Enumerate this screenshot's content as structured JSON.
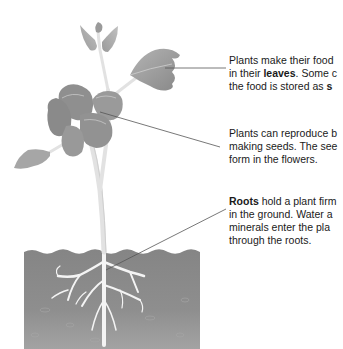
{
  "diagram": {
    "type": "labeled plant anatomy",
    "colors": {
      "soil": "#8c8c8c",
      "soil_dark": "#7a7a7a",
      "leaf": "#9a9a9a",
      "leaf_dark": "#7d7d7d",
      "stem": "#e6e6e6",
      "roots": "#f2f2f2",
      "leader_line": "#555555"
    },
    "labels": [
      {
        "id": "leaves",
        "lines": [
          {
            "pre": "Plants make their food",
            "bold": "",
            "post": ""
          },
          {
            "pre": "in their ",
            "bold": "leaves",
            "post": ". Some c"
          },
          {
            "pre": "the food is stored as ",
            "bold": "s",
            "post": ""
          }
        ]
      },
      {
        "id": "flowers",
        "lines": [
          {
            "pre": "Plants can reproduce b",
            "bold": "",
            "post": ""
          },
          {
            "pre": "making seeds. The see",
            "bold": "",
            "post": ""
          },
          {
            "pre": "form in the flowers.",
            "bold": "",
            "post": ""
          }
        ]
      },
      {
        "id": "roots",
        "lines": [
          {
            "pre": "",
            "bold": "Roots",
            "post": " hold a plant firm"
          },
          {
            "pre": "in the ground. Water a",
            "bold": "",
            "post": ""
          },
          {
            "pre": "minerals enter the pla",
            "bold": "",
            "post": ""
          },
          {
            "pre": "through the roots.",
            "bold": "",
            "post": ""
          }
        ]
      }
    ]
  }
}
